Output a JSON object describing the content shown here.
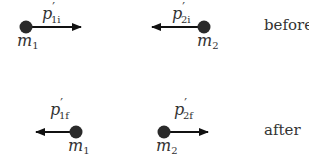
{
  "diagram": {
    "type": "collision-momentum",
    "colors": {
      "ink": "#222222",
      "text": "#333333",
      "background": "#ffffff"
    },
    "states": [
      {
        "label": "before",
        "bodies": [
          {
            "mass": "m",
            "mass_sub": "1",
            "momentum": "p",
            "momentum_prime": "′",
            "momentum_sub": "1i",
            "direction": "right"
          },
          {
            "mass": "m",
            "mass_sub": "2",
            "momentum": "p",
            "momentum_prime": "′",
            "momentum_sub": "2i",
            "direction": "left"
          }
        ]
      },
      {
        "label": "after",
        "bodies": [
          {
            "mass": "m",
            "mass_sub": "1",
            "momentum": "p",
            "momentum_prime": "′",
            "momentum_sub": "1f",
            "direction": "left"
          },
          {
            "mass": "m",
            "mass_sub": "2",
            "momentum": "p",
            "momentum_prime": "′",
            "momentum_sub": "2f",
            "direction": "right"
          }
        ]
      }
    ]
  }
}
